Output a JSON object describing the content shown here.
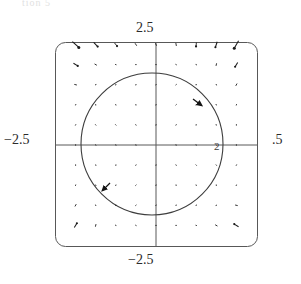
{
  "page": {
    "title_fragment": "tion 5",
    "background_color": "#ffffff",
    "width": 301,
    "height": 284
  },
  "figure": {
    "name": "phase-portrait",
    "frame": {
      "style": "rounded-rectangle",
      "stroke_color": "#555555",
      "corner_radius_px": 10,
      "left_px": 55,
      "top_px": 42,
      "right_px": 258,
      "bottom_px": 247
    },
    "axes": {
      "origin_px": {
        "x": 156,
        "y": 145
      },
      "x_axis_color": "#555555",
      "y_axis_color": "#555555",
      "x_label_left": "−2.5",
      "x_label_right": ".5",
      "y_label_top": "2.5",
      "y_label_bottom": "−2.5",
      "x_tick_labels": [
        "2"
      ],
      "x_range": [
        -2.5,
        2.5
      ],
      "y_range": [
        -2.5,
        2.5
      ]
    },
    "trajectory": {
      "name": "limit-cycle",
      "shape": "circle",
      "radius_units": 2,
      "center_units": [
        0,
        0
      ],
      "stroke_color": "#3a3a3a",
      "direction": "clockwise",
      "arrowheads": 2
    },
    "vector_field": {
      "grid_columns": 11,
      "grid_rows": 11,
      "arrow_color": "#1a1a1a",
      "sampling_min": -2.5,
      "sampling_max": 2.5
    }
  },
  "chart_data": {
    "type": "scatter",
    "title": "",
    "xlabel": "",
    "ylabel": "",
    "xlim": [
      -2.5,
      2.5
    ],
    "ylim": [
      -2.5,
      2.5
    ],
    "grid": false,
    "legend": null,
    "axis_tick_labels": {
      "top": "2.5",
      "bottom": "−2.5",
      "left": "−2.5",
      "right": ".5",
      "x_inner": [
        "2"
      ]
    },
    "annotations": [
      {
        "text": "2.5",
        "x": 0,
        "y": 2.5,
        "position": "above-axis"
      },
      {
        "text": "−2.5",
        "x": 0,
        "y": -2.5,
        "position": "below-axis"
      },
      {
        "text": "−2.5",
        "x": -2.5,
        "y": 0,
        "position": "left-of-axis"
      },
      {
        "text": ".5",
        "x": 2.5,
        "y": 0,
        "position": "right-of-axis"
      },
      {
        "text": "2",
        "x": 2,
        "y": 0,
        "position": "on-axis"
      }
    ],
    "overlays": [
      {
        "kind": "circle",
        "name": "limit-cycle",
        "cx": 0,
        "cy": 0,
        "r": 2,
        "direction": "clockwise",
        "arrow_angles_deg": [
          55,
          215
        ]
      }
    ],
    "vector_field": {
      "name": "direction-field",
      "x": [
        -2.5,
        -2.0,
        -1.5,
        -1.0,
        -0.5,
        0.0,
        0.5,
        1.0,
        1.5,
        2.0,
        2.5
      ],
      "y": [
        -2.5,
        -2.0,
        -1.5,
        -1.0,
        -0.5,
        0.0,
        0.5,
        1.0,
        1.5,
        2.0,
        2.5
      ],
      "formula_u": "x*(4 - x*x - y*y) + y",
      "formula_v": "y*(4 - x*x - y*y) - x",
      "note": "Arrows spiral clockwise toward the circle r = 2; magnitudes shrink near the cycle and near the origin."
    }
  }
}
